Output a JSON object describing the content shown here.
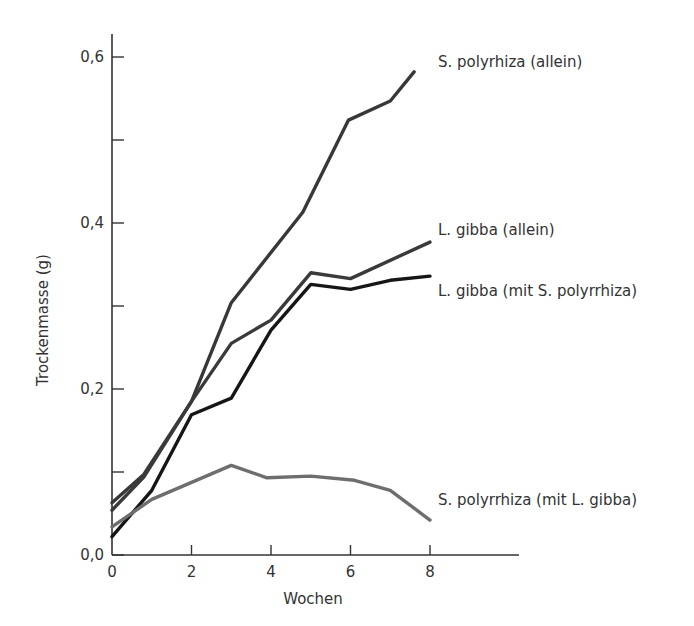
{
  "chart_data": {
    "type": "line",
    "title": "",
    "xlabel": "Wochen",
    "ylabel": "Trockenmasse (g)",
    "xlim": [
      0,
      10.2
    ],
    "ylim": [
      0,
      0.63
    ],
    "grid": false,
    "legend_position": "inline-right",
    "x_ticks": [
      0,
      2,
      4,
      6,
      8
    ],
    "x_tick_labels": [
      "0",
      "2",
      "4",
      "6",
      "8"
    ],
    "y_ticks": [
      0.0,
      0.2,
      0.4,
      0.6
    ],
    "y_tick_labels": [
      "0,0",
      "0,2",
      "0,4",
      "0,6"
    ],
    "y_minor_ticks": [
      0.1,
      0.3,
      0.5
    ],
    "series": [
      {
        "name": "S. polyrhiza (allein)",
        "color": "#383838",
        "x": [
          0,
          0.8,
          2,
          3,
          4.8,
          5.95,
          7,
          7.6
        ],
        "values": [
          0.063,
          0.097,
          0.185,
          0.304,
          0.413,
          0.524,
          0.547,
          0.582
        ]
      },
      {
        "name": "L. gibba (allein)",
        "color": "#3a3a3a",
        "x": [
          0,
          0.8,
          2,
          3,
          4,
          5,
          6,
          8
        ],
        "values": [
          0.054,
          0.094,
          0.185,
          0.255,
          0.283,
          0.34,
          0.333,
          0.377
        ]
      },
      {
        "name": "L. gibba (mit S. polyrrhiza)",
        "color": "#161616",
        "x": [
          0,
          1,
          2,
          3,
          4,
          5,
          6,
          7,
          8
        ],
        "values": [
          0.022,
          0.078,
          0.169,
          0.189,
          0.271,
          0.326,
          0.32,
          0.331,
          0.336
        ]
      },
      {
        "name": "S. polyrrhiza (mit L. gibba)",
        "color": "#6e6e6e",
        "x": [
          0,
          1,
          3,
          3.9,
          5,
          6.1,
          7,
          8
        ],
        "values": [
          0.034,
          0.067,
          0.108,
          0.093,
          0.095,
          0.09,
          0.078,
          0.042
        ]
      }
    ],
    "annotations": [
      {
        "text": "S. polyrhiza (allein)",
        "x_px": 438,
        "y_px": 62
      },
      {
        "text": "L. gibba (allein)",
        "x_px": 438,
        "y_px": 230
      },
      {
        "text": "L. gibba (mit S. polyrrhiza)",
        "x_px": 438,
        "y_px": 291
      },
      {
        "text": "S. polyrrhiza (mit L. gibba)",
        "x_px": 438,
        "y_px": 500
      }
    ]
  }
}
